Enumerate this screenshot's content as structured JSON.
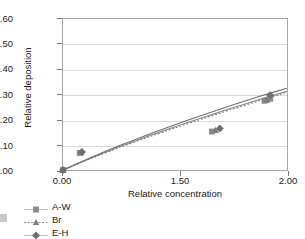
{
  "chart_data": {
    "type": "scatter",
    "title": "",
    "xlabel": "Relative concentration",
    "ylabel": "Relative deposition",
    "xlim": [
      0.0,
      2.0
    ],
    "ylim": [
      0.0,
      0.6
    ],
    "xticks": [
      "0.00",
      "1.50",
      "2.00"
    ],
    "xtick_values": [
      0.0,
      1.5,
      2.0
    ],
    "yticks": [
      "0.00",
      "0.10",
      "0.20",
      "0.30",
      "0.40",
      "0.50",
      "0.60"
    ],
    "ytick_values": [
      0.0,
      0.1,
      0.2,
      0.3,
      0.4,
      0.5,
      0.6
    ],
    "grid": "horizontal",
    "legend_position": "below-left",
    "series": [
      {
        "name": "A-W",
        "marker": "square",
        "color": "#8c8c8c",
        "line_style": "solid",
        "points": [
          {
            "x": 0.0,
            "y": 0.0
          },
          {
            "x": 0.15,
            "y": 0.068
          },
          {
            "x": 1.33,
            "y": 0.153
          },
          {
            "x": 1.8,
            "y": 0.275
          },
          {
            "x": 1.85,
            "y": 0.283
          }
        ],
        "curve": [
          {
            "x": 0.0,
            "y": 0.0
          },
          {
            "x": 0.25,
            "y": 0.048
          },
          {
            "x": 0.5,
            "y": 0.092
          },
          {
            "x": 0.75,
            "y": 0.133
          },
          {
            "x": 1.0,
            "y": 0.172
          },
          {
            "x": 1.25,
            "y": 0.209
          },
          {
            "x": 1.5,
            "y": 0.245
          },
          {
            "x": 1.75,
            "y": 0.28
          },
          {
            "x": 2.0,
            "y": 0.313
          }
        ]
      },
      {
        "name": "Br",
        "marker": "triangle",
        "color": "#7d7d7d",
        "line_style": "dotted",
        "points": [
          {
            "x": 0.0,
            "y": 0.0
          },
          {
            "x": 0.16,
            "y": 0.07
          },
          {
            "x": 1.36,
            "y": 0.158
          },
          {
            "x": 1.82,
            "y": 0.278
          }
        ],
        "curve": [
          {
            "x": 0.0,
            "y": 0.0
          },
          {
            "x": 0.25,
            "y": 0.046
          },
          {
            "x": 0.5,
            "y": 0.089
          },
          {
            "x": 0.75,
            "y": 0.129
          },
          {
            "x": 1.0,
            "y": 0.167
          },
          {
            "x": 1.25,
            "y": 0.204
          },
          {
            "x": 1.5,
            "y": 0.24
          },
          {
            "x": 1.75,
            "y": 0.275
          },
          {
            "x": 2.0,
            "y": 0.309
          }
        ]
      },
      {
        "name": "E-H",
        "marker": "diamond",
        "color": "#6f6f6f",
        "line_style": "solid",
        "points": [
          {
            "x": 0.0,
            "y": 0.0
          },
          {
            "x": 0.17,
            "y": 0.072
          },
          {
            "x": 1.4,
            "y": 0.165
          },
          {
            "x": 1.85,
            "y": 0.297
          }
        ],
        "curve": [
          {
            "x": 0.0,
            "y": 0.0
          },
          {
            "x": 0.25,
            "y": 0.05
          },
          {
            "x": 0.5,
            "y": 0.096
          },
          {
            "x": 0.75,
            "y": 0.139
          },
          {
            "x": 1.0,
            "y": 0.18
          },
          {
            "x": 1.25,
            "y": 0.219
          },
          {
            "x": 1.5,
            "y": 0.256
          },
          {
            "x": 1.75,
            "y": 0.292
          },
          {
            "x": 2.0,
            "y": 0.325
          }
        ]
      }
    ]
  },
  "legend": {
    "items": [
      {
        "label": "A-W"
      },
      {
        "label": "Br"
      },
      {
        "label": "E-H"
      }
    ]
  }
}
